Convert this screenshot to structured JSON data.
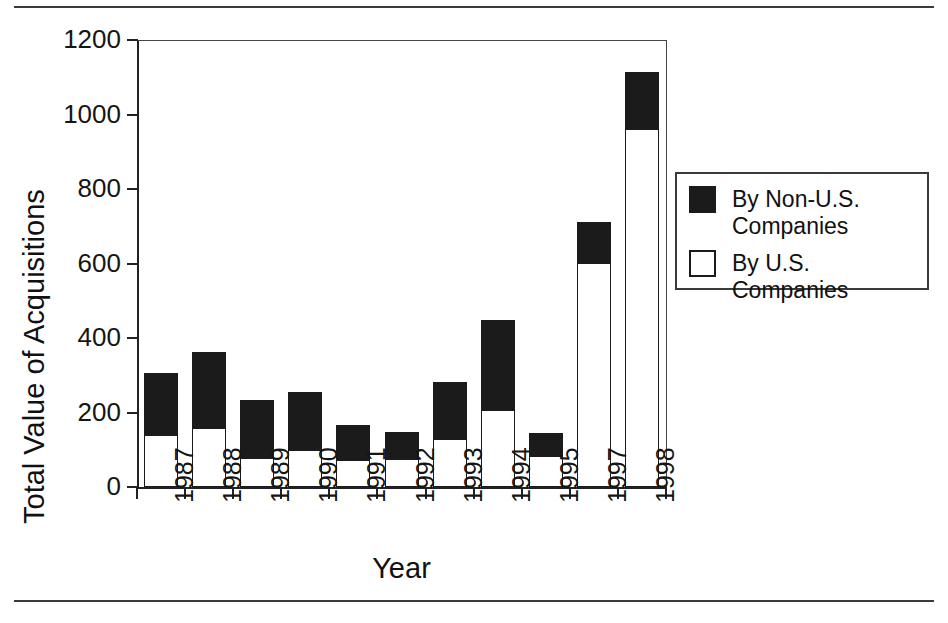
{
  "chart_data": {
    "type": "bar",
    "subtype": "stacked",
    "title": "",
    "xlabel": "Year",
    "ylabel": "Total Value of Acquisitions",
    "categories": [
      "1987",
      "1988",
      "1989",
      "1990",
      "1991",
      "1992",
      "1993",
      "1994",
      "1995",
      "1997",
      "1998"
    ],
    "series": [
      {
        "name": "By U.S. Companies",
        "color": "#ffffff",
        "edge_color": "#1b1b1b",
        "values": [
          140,
          158,
          78,
          100,
          72,
          75,
          130,
          207,
          82,
          600,
          960
        ]
      },
      {
        "name": "By Non-U.S. Companies",
        "color": "#1b1b1b",
        "edge_color": "#1b1b1b",
        "values": [
          166,
          204,
          155,
          155,
          94,
          73,
          152,
          241,
          63,
          111,
          154
        ]
      }
    ],
    "totals": [
      306,
      362,
      233,
      255,
      166,
      148,
      282,
      448,
      145,
      711,
      1114
    ],
    "ylim": [
      0,
      1200
    ],
    "yticks": [
      0,
      200,
      400,
      600,
      800,
      1000,
      1200
    ],
    "ytick_labels": [
      "0",
      "200",
      "400",
      "600",
      "800",
      "1000",
      "1200"
    ],
    "grid": false,
    "legend_position": "right"
  },
  "axes": {
    "ylabel": "Total Value of Acquisitions",
    "xlabel": "Year",
    "ytick_labels": [
      "1200",
      "1000",
      "800",
      "600",
      "400",
      "200",
      "0"
    ],
    "xtick_labels": [
      "1987",
      "1988",
      "1989",
      "1990",
      "1991",
      "1992",
      "1993",
      "1994",
      "1995",
      "1997",
      "1998"
    ]
  },
  "legend": {
    "entries": [
      {
        "label": "By Non-U.S.\nCompanies",
        "line1": "By Non-U.S.",
        "line2": "Companies",
        "swatch": "filled-square",
        "color": "#1b1b1b"
      },
      {
        "label": "By U.S. Companies",
        "line1": "By U.S. Companies",
        "line2": "",
        "swatch": "empty-square",
        "color": "#ffffff"
      }
    ]
  }
}
